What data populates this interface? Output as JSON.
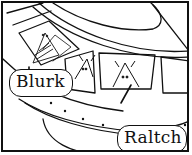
{
  "illustration": {
    "description": "Line drawing of a flying saucer with window panels, aliens inside",
    "labels": [
      {
        "id": "blurk",
        "text": "Blurk"
      },
      {
        "id": "raltch",
        "text": "Raltch"
      }
    ],
    "colors": {
      "ink": "#111111",
      "paper": "#ffffff"
    }
  }
}
